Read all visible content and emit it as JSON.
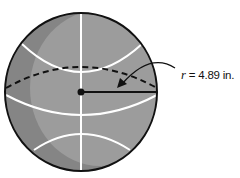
{
  "diagram": {
    "radius_label": {
      "variable": "r",
      "equals": " = ",
      "value": "4.89 in."
    },
    "colors": {
      "ball_fill": "#8c8c8c",
      "ball_highlight": "#a3a3a3",
      "ball_shadow": "#7a7a7a",
      "seams": "#ffffff",
      "outline": "#111111"
    }
  }
}
